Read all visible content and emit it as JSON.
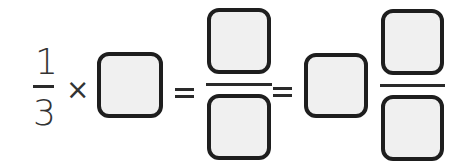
{
  "equation": {
    "given_fraction": {
      "numerator": "1",
      "denominator": "3"
    },
    "multiply_symbol": "×",
    "equals_symbol_1": "=",
    "equals_symbol_2": "=",
    "answer_boxes": [
      {
        "id": "factor",
        "value": ""
      },
      {
        "id": "product_numerator",
        "value": ""
      },
      {
        "id": "product_denominator",
        "value": ""
      },
      {
        "id": "whole_number",
        "value": ""
      },
      {
        "id": "mixed_numerator",
        "value": ""
      },
      {
        "id": "mixed_denominator",
        "value": ""
      }
    ]
  },
  "colors": {
    "box_border": "#1e1e1e",
    "box_fill": "#f0f0f0",
    "text": "#333333"
  }
}
